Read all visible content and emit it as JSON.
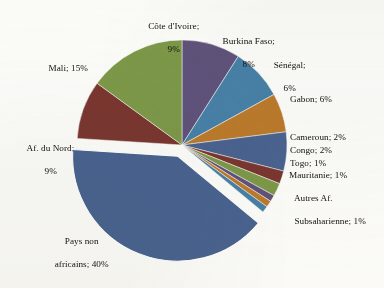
{
  "chart_data": {
    "type": "pie",
    "title": "",
    "subtitle": "",
    "xlabel": "",
    "ylabel": "",
    "grid": false,
    "legend_position": "none",
    "label_format": "name; percent",
    "start_angle_deg": 0,
    "direction": "clockwise",
    "exploded_slices": [
      "Pays non africains"
    ],
    "categories": [
      "Côte d'Ivoire",
      "Burkina Faso",
      "Sénégal",
      "Gabon",
      "Cameroun",
      "Congo",
      "Togo",
      "Mauritanie",
      "Autres Af. Subsaharienne",
      "Pays non africains",
      "Af. du Nord",
      "Mali"
    ],
    "values": [
      9,
      8,
      6,
      6,
      2,
      2,
      1,
      1,
      1,
      40,
      9,
      15
    ],
    "value_unit": "%",
    "colors": [
      "#60537c",
      "#4881a8",
      "#bd7b2c",
      "#4a6491",
      "#7a3730",
      "#7d9949",
      "#60537c",
      "#bd7b2c",
      "#4881a8",
      "#4a6491",
      "#7a3730",
      "#7d9949"
    ],
    "slices": [
      {
        "name": "Côte d'Ivoire",
        "value": 9,
        "label": "Côte d'Ivoire;",
        "value_label": "9%",
        "color": "#60537c"
      },
      {
        "name": "Burkina Faso",
        "value": 8,
        "label": "Burkina Faso;",
        "value_label": "8%",
        "color": "#4881a8"
      },
      {
        "name": "Sénégal",
        "value": 6,
        "label": "Sénégal;",
        "value_label": "6%",
        "color": "#bd7b2c"
      },
      {
        "name": "Gabon",
        "value": 6,
        "label": "Gabon; 6%",
        "value_label": "6%",
        "color": "#4a6491"
      },
      {
        "name": "Cameroun",
        "value": 2,
        "label": "Cameroun; 2%",
        "value_label": "2%",
        "color": "#7a3730"
      },
      {
        "name": "Congo",
        "value": 2,
        "label": "Congo; 2%",
        "value_label": "2%",
        "color": "#7d9949"
      },
      {
        "name": "Togo",
        "value": 1,
        "label": "Togo; 1%",
        "value_label": "1%",
        "color": "#60537c"
      },
      {
        "name": "Mauritanie",
        "value": 1,
        "label": "Mauritanie; 1%",
        "value_label": "1%",
        "color": "#bd7b2c"
      },
      {
        "name": "Autres Af. Subsaharienne",
        "value": 1,
        "label": "Autres Af. Subsaharienne; 1%",
        "value_label": "1%",
        "color": "#4881a8"
      },
      {
        "name": "Pays non africains",
        "value": 40,
        "label": "Pays non africains; 40%",
        "value_label": "40%",
        "color": "#4a6491"
      },
      {
        "name": "Af. du Nord",
        "value": 9,
        "label": "Af. du Nord;",
        "value_label": "9%",
        "color": "#7a3730"
      },
      {
        "name": "Mali",
        "value": 15,
        "label": "Mali; 15%",
        "value_label": "15%",
        "color": "#7d9949"
      }
    ]
  },
  "labels": {
    "cote_divoire_line1": "Côte d'Ivoire;",
    "cote_divoire_line2": "9%",
    "burkina_line1": "Burkina Faso;",
    "burkina_line2": "8%",
    "senegal_line1": "Sénégal;",
    "senegal_line2": "6%",
    "gabon": "Gabon; 6%",
    "cameroun": "Cameroun; 2%",
    "congo": "Congo; 2%",
    "togo": "Togo; 1%",
    "mauritanie": "Mauritanie; 1%",
    "autres_line1": "Autres Af.",
    "autres_line2": "Subsaharienne; 1%",
    "pays_non_africains_line1": "Pays non",
    "pays_non_africains_line2": "africains; 40%",
    "mali": "Mali; 15%",
    "af_du_nord_line1": "Af. du Nord;",
    "af_du_nord_line2": "9%"
  }
}
